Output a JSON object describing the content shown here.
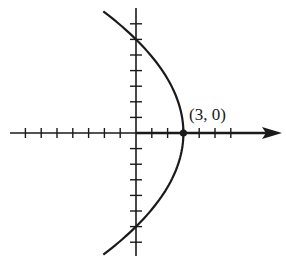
{
  "chart_data": {
    "type": "line",
    "title": "",
    "xlabel": "",
    "ylabel": "",
    "equation_implied": "x = 3 - y^2/12",
    "xlim": [
      -8,
      9
    ],
    "ylim": [
      -8,
      8
    ],
    "grid": false,
    "x_ticks_left": 7,
    "x_ticks_right": 6,
    "y_ticks_up": 7,
    "y_ticks_down": 7,
    "series": [
      {
        "name": "parabola",
        "points": [
          {
            "x": -2.1,
            "y": 7.8
          },
          {
            "x": 0,
            "y": 6
          },
          {
            "x": 1.67,
            "y": 4
          },
          {
            "x": 2.67,
            "y": 2
          },
          {
            "x": 3,
            "y": 0
          },
          {
            "x": 2.67,
            "y": -2
          },
          {
            "x": 1.67,
            "y": -4
          },
          {
            "x": 0,
            "y": -6
          },
          {
            "x": -2.1,
            "y": -7.8
          }
        ]
      }
    ],
    "annotations": [
      {
        "text": "(3, 0)",
        "x": 3,
        "y": 0,
        "marker": "dot"
      }
    ]
  },
  "labels": {
    "vertex": "(3, 0)"
  }
}
